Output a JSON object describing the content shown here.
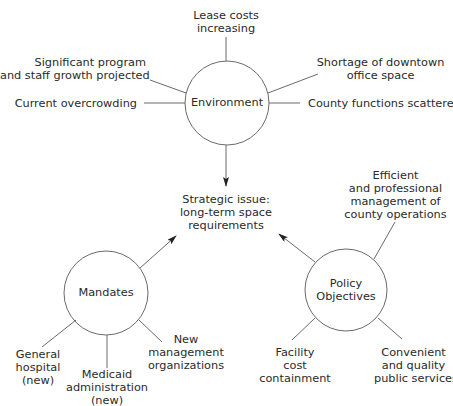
{
  "diagram": {
    "center": {
      "label": "Strategic issue:\nlong-term space\nrequirements"
    },
    "nodes": {
      "environment": {
        "label": "Environment",
        "factors": [
          "Lease costs\nincreasing",
          "Significant program\nand staff growth projected",
          "Current overcrowding",
          "Shortage of downtown\noffice space",
          "County functions scattered"
        ]
      },
      "mandates": {
        "label": "Mandates",
        "factors": [
          "General\nhospital\n(new)",
          "Medicaid\nadministration\n(new)",
          "New\nmanagement\norganizations"
        ]
      },
      "policy": {
        "label": "Policy\nObjectives",
        "factors": [
          "Efficient\nand professional\nmanagement of\ncounty operations",
          "Facility\ncost\ncontainment",
          "Convenient\nand quality\npublic services"
        ]
      }
    },
    "colors": {
      "line": "#6a6a6a",
      "arrow": "#222222",
      "text": "#2a2a2a"
    }
  }
}
